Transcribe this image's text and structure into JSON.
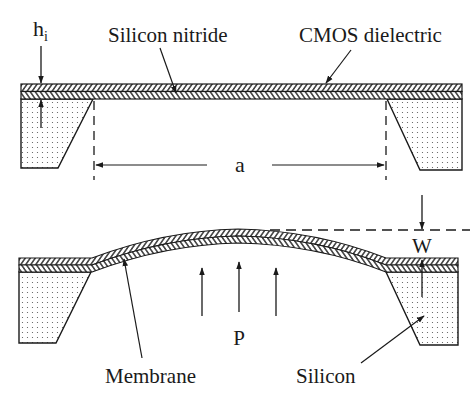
{
  "diagram": {
    "top_view": {
      "labels": {
        "thickness": "h",
        "thickness_subscript": "i",
        "silicon_nitride": "Silicon nitride",
        "cmos_dielectric": "CMOS dielectric",
        "width": "a"
      }
    },
    "bottom_view": {
      "labels": {
        "deflection": "W",
        "pressure": "P",
        "membrane": "Membrane",
        "silicon": "Silicon"
      }
    },
    "colors": {
      "line": "#1a1a1a",
      "background": "#ffffff",
      "silicon_dots": "#555555"
    }
  }
}
